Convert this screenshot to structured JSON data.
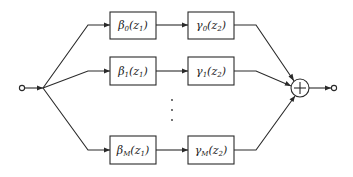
{
  "diagram": {
    "type": "parallel-branch block diagram",
    "input_node": {
      "label": ""
    },
    "output_node": {
      "label": ""
    },
    "summer": {
      "symbol": "+"
    },
    "branches": [
      {
        "index": "0",
        "block1": {
          "func": "β",
          "sub": "0",
          "arg": "z",
          "argsub": "1"
        },
        "block2": {
          "func": "γ",
          "sub": "0",
          "arg": "z",
          "argsub": "2"
        }
      },
      {
        "index": "1",
        "block1": {
          "func": "β",
          "sub": "1",
          "arg": "z",
          "argsub": "1"
        },
        "block2": {
          "func": "γ",
          "sub": "1",
          "arg": "z",
          "argsub": "2"
        }
      },
      {
        "index": "M",
        "block1": {
          "func": "β",
          "sub": "M",
          "arg": "z",
          "argsub": "1"
        },
        "block2": {
          "func": "γ",
          "sub": "M",
          "arg": "z",
          "argsub": "2"
        }
      }
    ],
    "ellipsis": "⋮"
  }
}
